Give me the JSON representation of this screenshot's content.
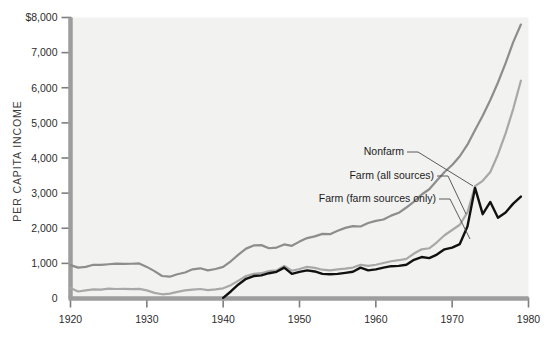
{
  "figure": {
    "background": "#ffffff",
    "plot_background": "#f2f2f1",
    "axis_color": "#9d9d9d",
    "width": 547,
    "height": 338
  },
  "axis": {
    "y_title": "PER CAPITA INCOME",
    "y_ticks": [
      "$8,000",
      "7,000",
      "6,000",
      "5,000",
      "4,000",
      "3,000",
      "2,000",
      "1,000",
      "0"
    ],
    "y_tick_values": [
      8000,
      7000,
      6000,
      5000,
      4000,
      3000,
      2000,
      1000,
      0
    ],
    "x_ticks": [
      "1920",
      "1930",
      "1940",
      "1950",
      "1960",
      "1970",
      "1980"
    ],
    "x_tick_values": [
      1920,
      1930,
      1940,
      1950,
      1960,
      1970,
      1980
    ]
  },
  "annotations": [
    {
      "label": "Nonfarm",
      "series": "nonfarm",
      "text_x": 404,
      "text_y": 155,
      "leader_to_x": 473,
      "leader_to_y": 186
    },
    {
      "label": "Farm (all sources)",
      "series": "farm_all_sources",
      "text_x": 434,
      "text_y": 179,
      "leader_to_x": 466,
      "leader_to_y": 214
    },
    {
      "label": "Farm (farm sources only)",
      "series": "farm_sources_only",
      "text_x": 436,
      "text_y": 202,
      "leader_to_x": 470,
      "leader_to_y": 239
    }
  ],
  "chart_data": {
    "type": "line",
    "title": "",
    "xlabel": "",
    "ylabel": "PER CAPITA INCOME",
    "xlim": [
      1920,
      1980
    ],
    "ylim": [
      0,
      8000
    ],
    "grid": false,
    "legend": "inline-annotations",
    "series": [
      {
        "name": "Nonfarm",
        "color": "#8d8d8d",
        "width": 2.2,
        "x": [
          1920,
          1921,
          1922,
          1923,
          1924,
          1925,
          1926,
          1927,
          1928,
          1929,
          1930,
          1931,
          1932,
          1933,
          1934,
          1935,
          1936,
          1937,
          1938,
          1939,
          1940,
          1941,
          1942,
          1943,
          1944,
          1945,
          1946,
          1947,
          1948,
          1949,
          1950,
          1951,
          1952,
          1953,
          1954,
          1955,
          1956,
          1957,
          1958,
          1959,
          1960,
          1961,
          1962,
          1963,
          1964,
          1965,
          1966,
          1967,
          1968,
          1969,
          1970,
          1971,
          1972,
          1973,
          1974,
          1975,
          1976,
          1977,
          1978,
          1979
        ],
        "y": [
          950,
          880,
          900,
          960,
          955,
          975,
          995,
          985,
          990,
          1000,
          900,
          780,
          640,
          620,
          690,
          740,
          830,
          860,
          800,
          840,
          900,
          1060,
          1250,
          1420,
          1510,
          1520,
          1430,
          1450,
          1540,
          1500,
          1620,
          1720,
          1770,
          1840,
          1830,
          1930,
          2010,
          2060,
          2050,
          2150,
          2210,
          2250,
          2360,
          2440,
          2590,
          2760,
          2960,
          3110,
          3360,
          3600,
          3800,
          4050,
          4380,
          4800,
          5200,
          5650,
          6150,
          6700,
          7300,
          7800
        ]
      },
      {
        "name": "Farm (all sources)",
        "color": "#a8a8a8",
        "width": 2.2,
        "x": [
          1920,
          1921,
          1922,
          1923,
          1924,
          1925,
          1926,
          1927,
          1928,
          1929,
          1930,
          1931,
          1932,
          1933,
          1934,
          1935,
          1936,
          1937,
          1938,
          1939,
          1940,
          1941,
          1942,
          1943,
          1944,
          1945,
          1946,
          1947,
          1948,
          1949,
          1950,
          1951,
          1952,
          1953,
          1954,
          1955,
          1956,
          1957,
          1958,
          1959,
          1960,
          1961,
          1962,
          1963,
          1964,
          1965,
          1966,
          1967,
          1968,
          1969,
          1970,
          1971,
          1972,
          1973,
          1974,
          1975,
          1976,
          1977,
          1978,
          1979
        ],
        "y": [
          300,
          200,
          230,
          260,
          255,
          280,
          270,
          275,
          265,
          275,
          230,
          160,
          120,
          140,
          190,
          230,
          250,
          270,
          240,
          260,
          290,
          380,
          510,
          640,
          700,
          720,
          780,
          800,
          930,
          790,
          840,
          900,
          870,
          820,
          800,
          830,
          850,
          880,
          960,
          930,
          960,
          1010,
          1060,
          1090,
          1130,
          1280,
          1400,
          1430,
          1600,
          1800,
          1950,
          2100,
          2450,
          3200,
          3350,
          3600,
          4100,
          4700,
          5400,
          6200
        ]
      },
      {
        "name": "Farm (farm sources only)",
        "color": "#111111",
        "width": 2.4,
        "x": [
          1940,
          1941,
          1942,
          1943,
          1944,
          1945,
          1946,
          1947,
          1948,
          1949,
          1950,
          1951,
          1952,
          1953,
          1954,
          1955,
          1956,
          1957,
          1958,
          1959,
          1960,
          1961,
          1962,
          1963,
          1964,
          1965,
          1966,
          1967,
          1968,
          1969,
          1970,
          1971,
          1972,
          1973,
          1974,
          1975,
          1976,
          1977,
          1978,
          1979
        ],
        "y": [
          20,
          200,
          400,
          560,
          640,
          660,
          720,
          760,
          880,
          700,
          760,
          800,
          770,
          700,
          690,
          700,
          730,
          760,
          880,
          800,
          830,
          880,
          920,
          930,
          960,
          1100,
          1180,
          1150,
          1250,
          1400,
          1450,
          1550,
          2050,
          3150,
          2400,
          2750,
          2300,
          2450,
          2700,
          2900
        ]
      }
    ]
  }
}
